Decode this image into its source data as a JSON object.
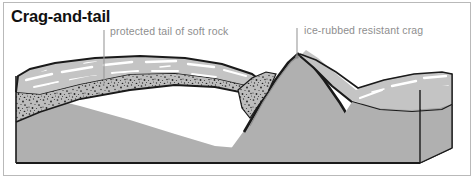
{
  "figure": {
    "title": "Crag-and-tail",
    "frame_color": "#b9b9b9",
    "background_color": "#ffffff"
  },
  "labels": {
    "tail": {
      "text": "protected tail of soft rock",
      "color": "#8e8e8e",
      "leader_x": 104,
      "leader_y_top": 30,
      "leader_y_bottom": 86
    },
    "crag": {
      "text": "ice-rubbed resistant crag",
      "color": "#8e8e8e",
      "leader_x": 297,
      "leader_y_top": 28,
      "leader_y_bottom": 56
    }
  },
  "legend_colors": {
    "bedrock_body": "#b0b0b0",
    "block_side": "#a8a8a8",
    "soft_rock_stipple_base": "#bdbdbd",
    "stipple_dots": "#2b2b2b",
    "ice_striation": "#ffffff",
    "outline": "#1a1a1a",
    "upper_surface": "#c4c4c4"
  },
  "geology": {
    "landform_type": "crag-and-tail",
    "components": [
      "ice-rubbed resistant crag",
      "protected tail of soft rock"
    ]
  }
}
